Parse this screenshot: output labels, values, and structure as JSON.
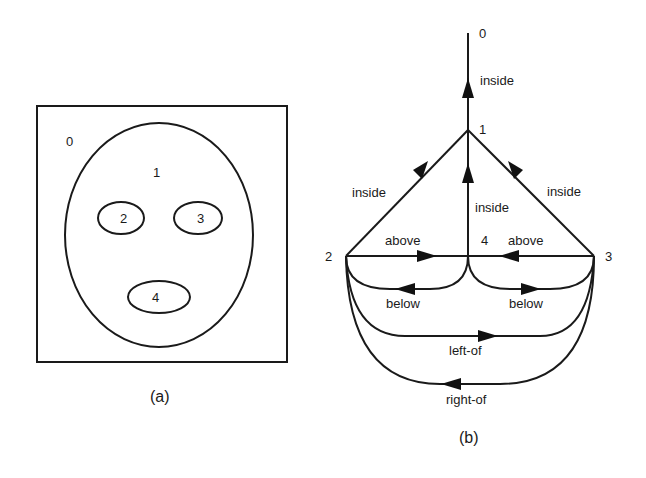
{
  "panel_a": {
    "caption": "(a)",
    "regions": [
      {
        "id": "0",
        "label": "0"
      },
      {
        "id": "1",
        "label": "1"
      },
      {
        "id": "2",
        "label": "2"
      },
      {
        "id": "3",
        "label": "3"
      },
      {
        "id": "4",
        "label": "4"
      }
    ]
  },
  "panel_b": {
    "caption": "(b)",
    "nodes": [
      {
        "id": "0",
        "label": "0"
      },
      {
        "id": "1",
        "label": "1"
      },
      {
        "id": "2",
        "label": "2"
      },
      {
        "id": "3",
        "label": "3"
      },
      {
        "id": "4",
        "label": "4"
      }
    ],
    "edges": [
      {
        "from": "1",
        "to": "0",
        "label": "inside"
      },
      {
        "from": "2",
        "to": "1",
        "label": "inside"
      },
      {
        "from": "4",
        "to": "1",
        "label": "inside"
      },
      {
        "from": "3",
        "to": "1",
        "label": "inside"
      },
      {
        "from": "2",
        "to": "4",
        "label": "above"
      },
      {
        "from": "3",
        "to": "4",
        "label": "above"
      },
      {
        "from": "4",
        "to": "2",
        "label": "below"
      },
      {
        "from": "4",
        "to": "3",
        "label": "below"
      },
      {
        "from": "2",
        "to": "3",
        "label": "left-of"
      },
      {
        "from": "3",
        "to": "2",
        "label": "right-of"
      }
    ]
  }
}
